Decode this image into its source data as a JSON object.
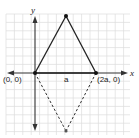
{
  "diagram": {
    "type": "coordinate-geometry",
    "axes": {
      "x_label": "x",
      "y_label": "y"
    },
    "points": [
      {
        "id": "origin",
        "label": "(0, 0)"
      },
      {
        "id": "right",
        "label": "(2a, 0)"
      },
      {
        "id": "top",
        "label": ""
      },
      {
        "id": "bottom",
        "label": ""
      }
    ],
    "base_midpoint_label": "a",
    "segments": [
      {
        "from": "origin",
        "to": "top",
        "style": "solid"
      },
      {
        "from": "top",
        "to": "right",
        "style": "solid"
      },
      {
        "from": "origin",
        "to": "right",
        "style": "solid"
      },
      {
        "from": "origin",
        "to": "bottom",
        "style": "dashed"
      },
      {
        "from": "right",
        "to": "bottom",
        "style": "dashed"
      }
    ],
    "colors": {
      "grid": "#dcdcdc",
      "axis": "#333333",
      "line": "#222222"
    }
  }
}
